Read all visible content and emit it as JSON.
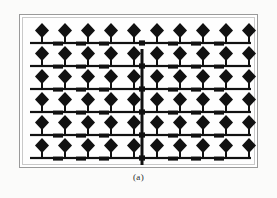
{
  "figure": {
    "caption": "(a)",
    "kind": "antenna-array-layout"
  },
  "panel": {
    "frame_color": "#9a9a9a",
    "inner_frame_color": "#c9c9c9",
    "background_color": "#ffffff",
    "x": 19,
    "y": 14,
    "width": 239,
    "height": 154
  },
  "page": {
    "background_color": "#fbfbfa",
    "ink_color": "#111111"
  },
  "chart_data": {
    "type": "diagram",
    "rows": 6,
    "columns": 10,
    "total_patches": 60,
    "patch_shape": "diamond",
    "patch_width": 14,
    "patch_height": 15,
    "row_y": [
      28,
      51,
      74,
      97,
      120,
      143
    ],
    "column_x": [
      22,
      45,
      68,
      91,
      114,
      137,
      160,
      183,
      206,
      229
    ],
    "feed_line": {
      "orientation": "horizontal",
      "thickness": 2.2,
      "color": "#111111",
      "x_start": 10,
      "x_end": 231
    },
    "vertical_feed": {
      "orientation": "vertical",
      "x": 122,
      "thickness": 3.0,
      "y_start": 34,
      "y_end": 150,
      "color": "#111111",
      "junction_marks": 6
    },
    "impedance_stubs": {
      "description": "thicker rectangular quarter-wave transformer segments between adjacent patches on each feed row",
      "per_row": 6,
      "width": 10,
      "height": 4,
      "color": "#111111",
      "offsets_x": [
        33,
        56,
        79,
        148,
        171,
        194
      ]
    },
    "patch_stem": {
      "description": "short vertical connector from each diamond patch down to the horizontal feed line",
      "width": 2,
      "height": 5,
      "color": "#111111"
    },
    "legend": [],
    "annotations": [
      "(a)"
    ]
  }
}
